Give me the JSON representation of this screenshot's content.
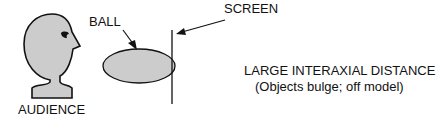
{
  "labels": {
    "ball": "BALL",
    "screen": "SCREEN",
    "audience": "AUDIENCE",
    "title": "LARGE INTERAXIAL DISTANCE",
    "subtitle": "(Objects bulge; off model)"
  },
  "colors": {
    "fill": "#cccccc",
    "stroke": "#111111"
  }
}
